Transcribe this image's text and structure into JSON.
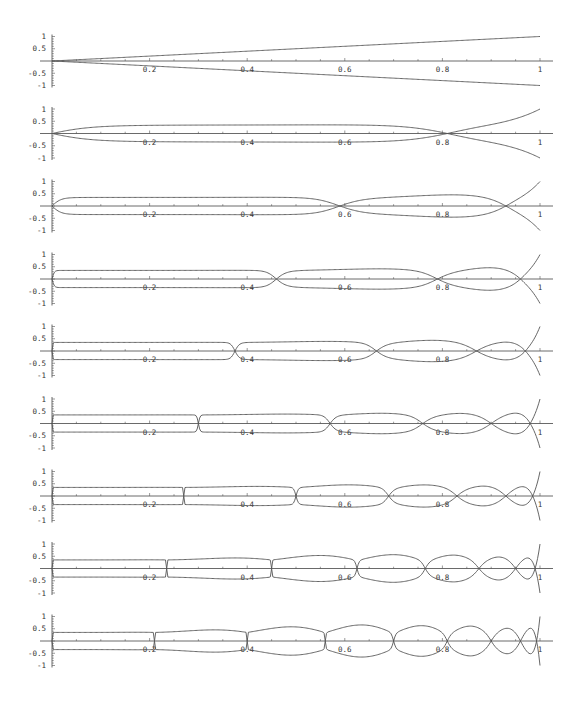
{
  "chart_data": {
    "type": "line",
    "layout": "9 stacked panels, shared x-range [0,1], y-range [-1,1]",
    "grid": false,
    "legend": null,
    "x_ticks": [
      "0.2",
      "0.4",
      "0.6",
      "0.8",
      "1"
    ],
    "y_ticks": [
      "1",
      "0.5",
      "-0.5",
      "-1"
    ],
    "xlim": [
      0,
      1
    ],
    "ylim": [
      -1,
      1
    ],
    "colors": {
      "curve": "#555555",
      "axis": "#444444",
      "text": "#333333"
    },
    "panels": [
      {
        "index": 1,
        "series": [
          "+f1(x)",
          "-f1(x)"
        ],
        "zeros": [],
        "value_at_1": 1
      },
      {
        "index": 2,
        "series": [
          "+f2(x)",
          "-f2(x)"
        ],
        "zeros": [
          0.81
        ],
        "value_at_1": 1
      },
      {
        "index": 3,
        "series": [
          "+f3(x)",
          "-f3(x)"
        ],
        "zeros": [
          0.59,
          0.93
        ],
        "value_at_1": 1
      },
      {
        "index": 4,
        "series": [
          "+f4(x)",
          "-f4(x)"
        ],
        "zeros": [
          0.46,
          0.79,
          0.96
        ],
        "value_at_1": 1
      },
      {
        "index": 5,
        "series": [
          "+f5(x)",
          "-f5(x)"
        ],
        "zeros": [
          0.375,
          0.665,
          0.87,
          0.97
        ],
        "value_at_1": 1
      },
      {
        "index": 6,
        "series": [
          "+f6(x)",
          "-f6(x)"
        ],
        "zeros": [
          0.3,
          0.57,
          0.76,
          0.9,
          0.98
        ],
        "value_at_1": 1
      },
      {
        "index": 7,
        "series": [
          "+f7(x)",
          "-f7(x)"
        ],
        "zeros": [
          0.27,
          0.5,
          0.69,
          0.83,
          0.93,
          0.985
        ],
        "value_at_1": 1
      },
      {
        "index": 8,
        "series": [
          "+f8(x)",
          "-f8(x)"
        ],
        "zeros": [
          0.235,
          0.45,
          0.625,
          0.765,
          0.875,
          0.95,
          0.99
        ],
        "value_at_1": 1
      },
      {
        "index": 9,
        "series": [
          "+f9(x)",
          "-f9(x)"
        ],
        "zeros": [
          0.21,
          0.4,
          0.56,
          0.7,
          0.81,
          0.9,
          0.96,
          0.993
        ],
        "value_at_1": 1
      }
    ]
  }
}
